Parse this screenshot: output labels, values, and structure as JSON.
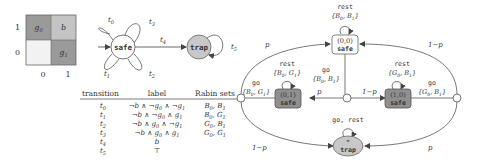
{
  "grid": {
    "cells": [
      {
        "label": "g0",
        "row": 1,
        "col": 0,
        "fill": "#9a9a9a"
      },
      {
        "label": "b",
        "row": 1,
        "col": 1,
        "fill": "#c4c4c4"
      },
      {
        "label": "",
        "row": 0,
        "col": 0,
        "fill": "#f2f2f2"
      },
      {
        "label": "g1",
        "row": 0,
        "col": 1,
        "fill": "#9a9a9a"
      }
    ],
    "y_ticks": [
      "1",
      "0"
    ],
    "x_ticks": [
      "0",
      "1"
    ]
  },
  "automaton": {
    "states": [
      {
        "name": "safe",
        "fill": "#ffffff"
      },
      {
        "name": "trap",
        "fill": "#c8c8c8"
      }
    ],
    "edge_labels": {
      "t0": "t0",
      "t1": "t1",
      "t2": "t2",
      "t3": "t3",
      "t4": "t4",
      "t5": "t5"
    }
  },
  "table": {
    "headers": [
      "transition",
      "label",
      "Rabin sets"
    ],
    "rows": [
      {
        "transition": "t0",
        "label": "¬b ∧ ¬g0 ∧ ¬g1",
        "rabin": "B0, B1"
      },
      {
        "transition": "t1",
        "label": "¬b ∧ ¬g0 ∧ g1",
        "rabin": "B0, G1"
      },
      {
        "transition": "t2",
        "label": "¬b ∧ g0 ∧ ¬g1",
        "rabin": "G0, B1"
      },
      {
        "transition": "t3",
        "label": "¬b ∧ g0 ∧ g1",
        "rabin": "G0, G1"
      },
      {
        "transition": "t4",
        "label": "b",
        "rabin": ""
      },
      {
        "transition": "t5",
        "label": "⊤",
        "rabin": ""
      }
    ]
  },
  "mdp": {
    "states": [
      {
        "id": "s00",
        "coord": "(0,0)",
        "name": "safe",
        "self_action": "rest",
        "self_set": "{B0, B1}",
        "fill": "#ffffff"
      },
      {
        "id": "s01",
        "coord": "(0,1)",
        "name": "safe",
        "self_action": "rest",
        "self_set": "{B0, G1}",
        "fill": "#8f8f8f"
      },
      {
        "id": "s10",
        "coord": "(1,0)",
        "name": "safe",
        "self_action": "rest",
        "self_set": "{G0, B1}",
        "fill": "#8f8f8f"
      },
      {
        "id": "trap",
        "coord": "*",
        "name": "trap",
        "self_action": "go, rest",
        "fill": "#c8c8c8"
      }
    ],
    "go_labels": {
      "left": {
        "action": "go",
        "set": "{B0, G1}"
      },
      "center": {
        "action": "go",
        "set": "{B0, B1}"
      },
      "right": {
        "action": "go",
        "set": "{G0, B1}"
      }
    },
    "probabilities": {
      "left_to_s00": "p",
      "left_to_trap": "1−p",
      "center_to_s01": "p",
      "center_to_s10": "1−p",
      "right_to_s00": "1−p",
      "right_to_trap": "p"
    }
  }
}
